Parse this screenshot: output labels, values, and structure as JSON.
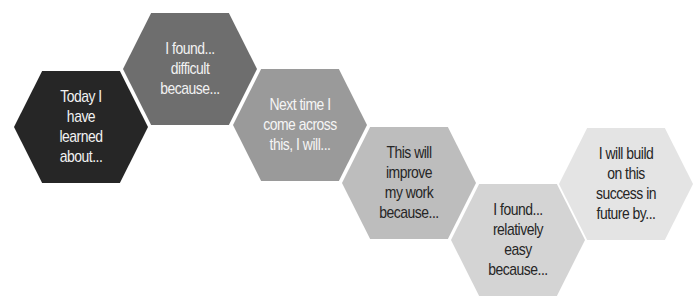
{
  "diagram": {
    "type": "hexagon-sequence",
    "hexagons": [
      {
        "label": "Today I\nhave\nlearned\nabout...",
        "fill": "#262626",
        "text_color": "#f2f2f2"
      },
      {
        "label": "I found...\ndifficult\nbecause...",
        "fill": "#6e6e6e",
        "text_color": "#f2f2f2"
      },
      {
        "label": "Next time I\ncome across\nthis, I will...",
        "fill": "#9a9a9a",
        "text_color": "#f5f5f5"
      },
      {
        "label": "This will\nimprove\nmy work\nbecause...",
        "fill": "#bdbdbd",
        "text_color": "#262626"
      },
      {
        "label": "I found...\nrelatively\neasy\nbecause...",
        "fill": "#d4d4d4",
        "text_color": "#262626"
      },
      {
        "label": "I will build\non this\nsuccess in\nfuture by...",
        "fill": "#e4e4e4",
        "text_color": "#262626"
      }
    ]
  }
}
